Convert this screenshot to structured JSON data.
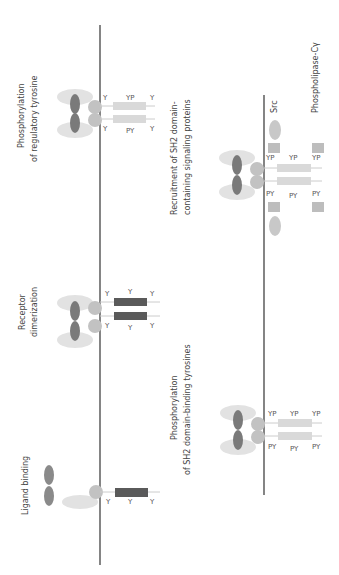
{
  "diagram": {
    "steps": [
      {
        "id": "ligand",
        "label_lines": [
          "Ligand binding"
        ]
      },
      {
        "id": "dimer",
        "label_lines": [
          "Receptor",
          "dimerization"
        ]
      },
      {
        "id": "reg",
        "label_lines": [
          "Phosphorylation",
          "of regulatory tyrosine"
        ]
      },
      {
        "id": "sh2bind",
        "label_lines": [
          "Phosphorylation",
          "of SH2 domain-binding tyrosines"
        ]
      },
      {
        "id": "recruit",
        "label_lines": [
          "Recruitment of SH2 domain-",
          "containing signaling proteins"
        ]
      }
    ],
    "proteins": {
      "src": "Src",
      "plc": "Phospholipase-Cγ"
    },
    "residue_labels": {
      "Y": "Y",
      "YP": "YP",
      "PY": "PY"
    },
    "colors": {
      "membrane": "#333333",
      "ligand": "#8a8a8a",
      "ext_light": "#e0e0e0",
      "ext_mid": "#bdbdbd",
      "kinase_dark": "#5a5a5a",
      "kinase_light": "#d9d9d9",
      "adapter": "#c4c4c4"
    }
  }
}
